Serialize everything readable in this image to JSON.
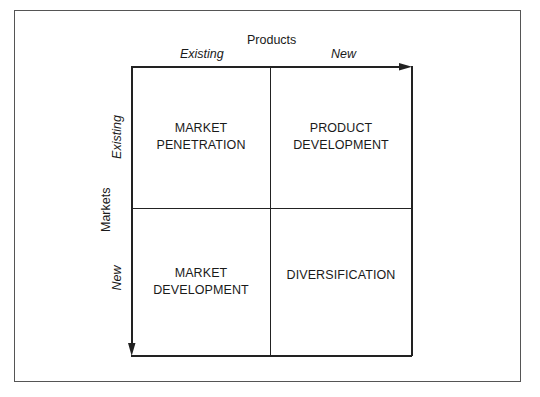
{
  "diagram": {
    "type": "ansoff-matrix",
    "x_axis": {
      "title": "Products",
      "labels": [
        "Existing",
        "New"
      ]
    },
    "y_axis": {
      "title": "Markets",
      "labels": [
        "Existing",
        "New"
      ]
    },
    "quadrants": [
      {
        "row": 0,
        "col": 0,
        "line1": "MARKET",
        "line2": "PENETRATION"
      },
      {
        "row": 0,
        "col": 1,
        "line1": "PRODUCT",
        "line2": "DEVELOPMENT"
      },
      {
        "row": 1,
        "col": 0,
        "line1": "MARKET",
        "line2": "DEVELOPMENT"
      },
      {
        "row": 1,
        "col": 1,
        "line1": "DIVERSIFICATION",
        "line2": ""
      }
    ],
    "colors": {
      "line": "#222222",
      "frame": "#555555",
      "background": "#ffffff",
      "text": "#1a1a1a"
    }
  }
}
